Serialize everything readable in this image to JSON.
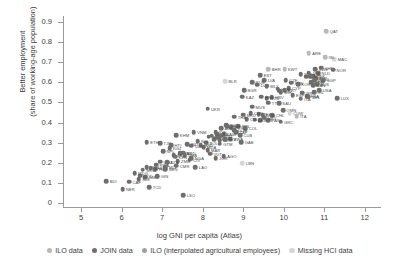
{
  "chart_data": {
    "type": "scatter",
    "title": "",
    "xlabel": "log GNI per capita (Atlas)",
    "ylabel": "Better employment\n(share of working-age population)",
    "xlim": [
      4.55,
      12.4
    ],
    "ylim": [
      -0.02,
      0.93
    ],
    "xticks": [
      5,
      6,
      7,
      8,
      9,
      10,
      11,
      12
    ],
    "yticks": [
      "0",
      "0.1",
      "0.2",
      "0.3",
      "0.4",
      "0.5",
      "0.6",
      "0.7",
      "0.8",
      "0.9"
    ],
    "grid": false,
    "legend_position": "bottom",
    "series": [
      {
        "name": "ILO data",
        "color": "#b8b8b8"
      },
      {
        "name": "JOIN data",
        "color": "#6e6e6e"
      },
      {
        "name": "ILO (interpolated agricultural employees)",
        "color": "#a0a0a0"
      },
      {
        "name": "Missing HCI data",
        "color": "#d6d6d6"
      }
    ],
    "points": [
      {
        "label": "QAT",
        "x": 11.05,
        "y": 0.855,
        "s": 0
      },
      {
        "label": "ARE",
        "x": 10.62,
        "y": 0.745,
        "s": 0
      },
      {
        "label": "MAC",
        "x": 11.25,
        "y": 0.715,
        "s": 3
      },
      {
        "label": "ISL",
        "x": 11.02,
        "y": 0.725,
        "s": 0
      },
      {
        "label": "KWT",
        "x": 10.02,
        "y": 0.665,
        "s": 0
      },
      {
        "label": "BHR",
        "x": 9.62,
        "y": 0.665,
        "s": 0
      },
      {
        "label": "SWE",
        "x": 10.78,
        "y": 0.665,
        "s": 1
      },
      {
        "label": "CHE",
        "x": 10.92,
        "y": 0.672,
        "s": 1
      },
      {
        "label": "NOR",
        "x": 11.22,
        "y": 0.662,
        "s": 1
      },
      {
        "label": "EST",
        "x": 9.42,
        "y": 0.635,
        "s": 1
      },
      {
        "label": "NLD",
        "x": 10.85,
        "y": 0.645,
        "s": 1
      },
      {
        "label": "LIT",
        "x": 10.55,
        "y": 0.628,
        "s": 1
      },
      {
        "label": "DNK",
        "x": 10.72,
        "y": 0.63,
        "s": 1
      },
      {
        "label": "JPN",
        "x": 10.62,
        "y": 0.648,
        "s": 1
      },
      {
        "label": "MLT",
        "x": 10.42,
        "y": 0.64,
        "s": 1
      },
      {
        "label": "AUT",
        "x": 10.78,
        "y": 0.62,
        "s": 1
      },
      {
        "label": "DEU",
        "x": 10.8,
        "y": 0.618,
        "s": 1
      },
      {
        "label": "NZL",
        "x": 10.65,
        "y": 0.63,
        "s": 1
      },
      {
        "label": "FIN",
        "x": 10.75,
        "y": 0.608,
        "s": 1
      },
      {
        "label": "SGP",
        "x": 10.98,
        "y": 0.61,
        "s": 1
      },
      {
        "label": "GBR",
        "x": 10.68,
        "y": 0.6,
        "s": 1
      },
      {
        "label": "CZE",
        "x": 10.05,
        "y": 0.612,
        "s": 1
      },
      {
        "label": "SVN",
        "x": 10.18,
        "y": 0.598,
        "s": 1
      },
      {
        "label": "KOR",
        "x": 10.35,
        "y": 0.59,
        "s": 1
      },
      {
        "label": "AUS",
        "x": 10.82,
        "y": 0.592,
        "s": 1
      },
      {
        "label": "CAN",
        "x": 10.72,
        "y": 0.585,
        "s": 1
      },
      {
        "label": "LVA",
        "x": 9.52,
        "y": 0.612,
        "s": 1
      },
      {
        "label": "RUS",
        "x": 9.22,
        "y": 0.6,
        "s": 1
      },
      {
        "label": "DZA",
        "x": 9.35,
        "y": 0.588,
        "s": 1
      },
      {
        "label": "MLY",
        "x": 9.58,
        "y": 0.58,
        "s": 1
      },
      {
        "label": "CYP",
        "x": 10.12,
        "y": 0.572,
        "s": 1
      },
      {
        "label": "BLR",
        "x": 8.55,
        "y": 0.605,
        "s": 3
      },
      {
        "label": "HUN",
        "x": 9.85,
        "y": 0.568,
        "s": 1
      },
      {
        "label": "POL",
        "x": 9.88,
        "y": 0.558,
        "s": 1
      },
      {
        "label": "PRT",
        "x": 10.02,
        "y": 0.56,
        "s": 1
      },
      {
        "label": "SVK",
        "x": 9.92,
        "y": 0.552,
        "s": 1
      },
      {
        "label": "BGR",
        "x": 9.02,
        "y": 0.56,
        "s": 1
      },
      {
        "label": "IRL",
        "x": 10.75,
        "y": 0.552,
        "s": 1
      },
      {
        "label": "USA",
        "x": 10.88,
        "y": 0.56,
        "s": 1
      },
      {
        "label": "ISR",
        "x": 10.45,
        "y": 0.548,
        "s": 1
      },
      {
        "label": "ESP",
        "x": 10.22,
        "y": 0.535,
        "s": 1
      },
      {
        "label": "FRA",
        "x": 10.58,
        "y": 0.532,
        "s": 1
      },
      {
        "label": "BEL",
        "x": 10.62,
        "y": 0.528,
        "s": 1
      },
      {
        "label": "ITA",
        "x": 10.42,
        "y": 0.518,
        "s": 1
      },
      {
        "label": "KAZ",
        "x": 8.98,
        "y": 0.528,
        "s": 1
      },
      {
        "label": "HRV",
        "x": 9.7,
        "y": 0.525,
        "s": 1
      },
      {
        "label": "ROU",
        "x": 9.58,
        "y": 0.52,
        "s": 1
      },
      {
        "label": "LUX",
        "x": 11.32,
        "y": 0.522,
        "s": 1
      },
      {
        "label": "HKG",
        "x": 9.45,
        "y": 0.528,
        "s": 1
      },
      {
        "label": "TTO",
        "x": 9.62,
        "y": 0.498,
        "s": 1
      },
      {
        "label": "SAU",
        "x": 9.88,
        "y": 0.495,
        "s": 1
      },
      {
        "label": "MUS",
        "x": 9.22,
        "y": 0.478,
        "s": 1
      },
      {
        "label": "UKR",
        "x": 8.12,
        "y": 0.468,
        "s": 1
      },
      {
        "label": "OMN",
        "x": 9.98,
        "y": 0.462,
        "s": 1
      },
      {
        "label": "CUW",
        "x": 10.15,
        "y": 0.448,
        "s": 3
      },
      {
        "label": "ITA2",
        "x": 10.32,
        "y": 0.432,
        "s": 0
      },
      {
        "label": "MEX",
        "x": 9.38,
        "y": 0.442,
        "s": 1
      },
      {
        "label": "CHN",
        "x": 9.18,
        "y": 0.448,
        "s": 1
      },
      {
        "label": "MKD",
        "x": 9.0,
        "y": 0.44,
        "s": 1
      },
      {
        "label": "CHL",
        "x": 9.72,
        "y": 0.436,
        "s": 1
      },
      {
        "label": "BRA",
        "x": 9.48,
        "y": 0.438,
        "s": 1
      },
      {
        "label": "TUR",
        "x": 9.42,
        "y": 0.412,
        "s": 1
      },
      {
        "label": "PAN",
        "x": 9.62,
        "y": 0.412,
        "s": 1
      },
      {
        "label": "GRC",
        "x": 9.92,
        "y": 0.405,
        "s": 1
      },
      {
        "label": "ARG",
        "x": 9.28,
        "y": 0.415,
        "s": 1
      },
      {
        "label": "CRI",
        "x": 9.08,
        "y": 0.418,
        "s": 1
      },
      {
        "label": "URY",
        "x": 9.52,
        "y": 0.425,
        "s": 1
      },
      {
        "label": "THA",
        "x": 8.78,
        "y": 0.43,
        "s": 1
      },
      {
        "label": "TUN",
        "x": 8.58,
        "y": 0.388,
        "s": 1
      },
      {
        "label": "IRN",
        "x": 8.88,
        "y": 0.382,
        "s": 1
      },
      {
        "label": "COL",
        "x": 9.05,
        "y": 0.372,
        "s": 1
      },
      {
        "label": "ECU",
        "x": 8.7,
        "y": 0.378,
        "s": 1
      },
      {
        "label": "PER",
        "x": 8.62,
        "y": 0.382,
        "s": 1
      },
      {
        "label": "ALB",
        "x": 8.45,
        "y": 0.372,
        "s": 1
      },
      {
        "label": "DOM",
        "x": 8.78,
        "y": 0.362,
        "s": 1
      },
      {
        "label": "ZAF",
        "x": 8.82,
        "y": 0.352,
        "s": 1
      },
      {
        "label": "CUB",
        "x": 8.92,
        "y": 0.338,
        "s": 1
      },
      {
        "label": "JAM",
        "x": 8.52,
        "y": 0.342,
        "s": 1
      },
      {
        "label": "BWA",
        "x": 8.68,
        "y": 0.32,
        "s": 1
      },
      {
        "label": "GAB",
        "x": 8.95,
        "y": 0.302,
        "s": 1
      },
      {
        "label": "IDN",
        "x": 8.32,
        "y": 0.352,
        "s": 1
      },
      {
        "label": "LKA",
        "x": 8.35,
        "y": 0.342,
        "s": 1
      },
      {
        "label": "VNM",
        "x": 7.78,
        "y": 0.352,
        "s": 1
      },
      {
        "label": "PHL",
        "x": 8.15,
        "y": 0.33,
        "s": 1
      },
      {
        "label": "EGY",
        "x": 8.28,
        "y": 0.318,
        "s": 1
      },
      {
        "label": "MNG",
        "x": 8.22,
        "y": 0.335,
        "s": 1
      },
      {
        "label": "GEO",
        "x": 8.38,
        "y": 0.325,
        "s": 1
      },
      {
        "label": "ARM",
        "x": 8.42,
        "y": 0.312,
        "s": 1
      },
      {
        "label": "KHM",
        "x": 7.35,
        "y": 0.338,
        "s": 1
      },
      {
        "label": "TJK",
        "x": 6.95,
        "y": 0.298,
        "s": 1
      },
      {
        "label": "ETH",
        "x": 6.62,
        "y": 0.302,
        "s": 1
      },
      {
        "label": "BOL",
        "x": 8.08,
        "y": 0.3,
        "s": 1
      },
      {
        "label": "IND",
        "x": 7.62,
        "y": 0.292,
        "s": 1
      },
      {
        "label": "MAR",
        "x": 8.12,
        "y": 0.262,
        "s": 1
      },
      {
        "label": "VUT",
        "x": 8.18,
        "y": 0.245,
        "s": 1
      },
      {
        "label": "AGO",
        "x": 8.52,
        "y": 0.232,
        "s": 1
      },
      {
        "label": "LBN",
        "x": 8.98,
        "y": 0.198,
        "s": 3
      },
      {
        "label": "KGZ",
        "x": 7.18,
        "y": 0.272,
        "s": 1
      },
      {
        "label": "NPL",
        "x": 7.02,
        "y": 0.258,
        "s": 1
      },
      {
        "label": "PAK",
        "x": 7.45,
        "y": 0.248,
        "s": 1
      },
      {
        "label": "BGD",
        "x": 7.52,
        "y": 0.25,
        "s": 1
      },
      {
        "label": "SEN",
        "x": 7.28,
        "y": 0.238,
        "s": 1
      },
      {
        "label": "GHA",
        "x": 7.55,
        "y": 0.238,
        "s": 1
      },
      {
        "label": "KEN",
        "x": 7.32,
        "y": 0.23,
        "s": 1
      },
      {
        "label": "NGA",
        "x": 7.72,
        "y": 0.222,
        "s": 1
      },
      {
        "label": "CIV",
        "x": 7.68,
        "y": 0.215,
        "s": 1
      },
      {
        "label": "ZMB",
        "x": 7.38,
        "y": 0.208,
        "s": 1
      },
      {
        "label": "UGA",
        "x": 6.95,
        "y": 0.205,
        "s": 1
      },
      {
        "label": "TZA",
        "x": 7.12,
        "y": 0.202,
        "s": 1
      },
      {
        "label": "MWI",
        "x": 6.62,
        "y": 0.178,
        "s": 1
      },
      {
        "label": "RWA",
        "x": 6.85,
        "y": 0.19,
        "s": 1
      },
      {
        "label": "MLI",
        "x": 7.08,
        "y": 0.178,
        "s": 1
      },
      {
        "label": "LAO",
        "x": 7.82,
        "y": 0.178,
        "s": 1
      },
      {
        "label": "MOZ",
        "x": 6.52,
        "y": 0.165,
        "s": 1
      },
      {
        "label": "TGO",
        "x": 6.82,
        "y": 0.168,
        "s": 1
      },
      {
        "label": "BFA",
        "x": 6.72,
        "y": 0.172,
        "s": 1
      },
      {
        "label": "CMR",
        "x": 7.35,
        "y": 0.185,
        "s": 1
      },
      {
        "label": "BEN",
        "x": 7.08,
        "y": 0.168,
        "s": 1
      },
      {
        "label": "BDI",
        "x": 5.62,
        "y": 0.108,
        "s": 1
      },
      {
        "label": "CAF",
        "x": 6.18,
        "y": 0.105,
        "s": 1
      },
      {
        "label": "NER",
        "x": 6.02,
        "y": 0.068,
        "s": 1
      },
      {
        "label": "TCD",
        "x": 6.68,
        "y": 0.078,
        "s": 1
      },
      {
        "label": "LSO",
        "x": 7.52,
        "y": 0.04,
        "s": 1
      },
      {
        "label": "SLE",
        "x": 6.42,
        "y": 0.118,
        "s": 1
      },
      {
        "label": "GMB",
        "x": 6.58,
        "y": 0.128,
        "s": 1
      },
      {
        "label": "COD",
        "x": 6.45,
        "y": 0.135,
        "s": 1
      },
      {
        "label": "MDG",
        "x": 6.32,
        "y": 0.148,
        "s": 1
      },
      {
        "label": "GIN",
        "x": 6.88,
        "y": 0.132,
        "s": 1
      },
      {
        "label": "HTI",
        "x": 7.22,
        "y": 0.288,
        "s": 1
      },
      {
        "label": "SLV",
        "x": 8.55,
        "y": 0.318,
        "s": 1
      },
      {
        "label": "GTM",
        "x": 8.42,
        "y": 0.295,
        "s": 1
      },
      {
        "label": "HND",
        "x": 7.95,
        "y": 0.288,
        "s": 1
      },
      {
        "label": "PRY",
        "x": 8.45,
        "y": 0.335,
        "s": 1
      },
      {
        "label": "NIC",
        "x": 7.88,
        "y": 0.308,
        "s": 1
      },
      {
        "label": "JOR",
        "x": 8.32,
        "y": 0.222,
        "s": 1
      },
      {
        "label": "MDA",
        "x": 8.02,
        "y": 0.278,
        "s": 1
      },
      {
        "label": "UZB",
        "x": 7.72,
        "y": 0.285,
        "s": 1
      }
    ]
  }
}
